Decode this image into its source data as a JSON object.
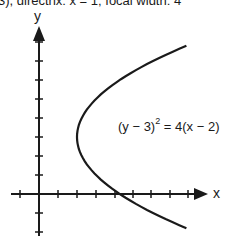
{
  "caption": "3), directrix: x = 1; focal width: 4",
  "axes": {
    "x_label": "x",
    "y_label": "y",
    "x_ticks": [
      -1,
      1,
      2,
      3,
      4,
      5,
      6,
      7,
      8
    ],
    "y_ticks": [
      -2,
      -1,
      1,
      2,
      3,
      4,
      5,
      6,
      7,
      8
    ]
  },
  "equation": {
    "left": "(y − 3)",
    "exponent": "2",
    "right": " = 4(x − 2)"
  },
  "curve": {
    "type": "parabola",
    "vertex": [
      2,
      3
    ],
    "opens": "right",
    "y_range": [
      -1.8,
      7.8
    ]
  },
  "colors": {
    "ink": "#1a1a1a",
    "background": "#ffffff"
  }
}
